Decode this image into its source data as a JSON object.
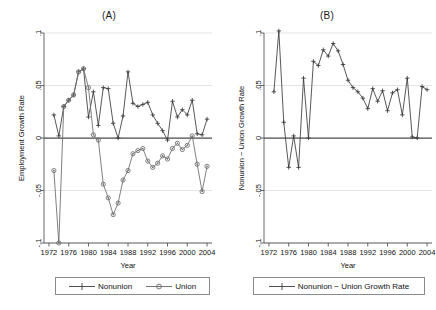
{
  "figure": {
    "background": "#ffffff",
    "axis_color": "#555555",
    "grid_color": "#d8d8d8",
    "series_color": "#3a3a3a",
    "union_color": "#6a6a6a"
  },
  "panels": [
    {
      "id": "panel-a",
      "title": "(A)",
      "ylabel": "Employment Growth Rate",
      "xlabel": "Year",
      "legend": [
        {
          "label": "Nonunion",
          "marker": "plus"
        },
        {
          "label": "Union",
          "marker": "circle-dot"
        }
      ]
    },
    {
      "id": "panel-b",
      "title": "(B)",
      "ylabel": "Nonunion − Union Growth Rate",
      "xlabel": "Year",
      "legend": [
        {
          "label": "Nonunion − Union Growth Rate",
          "marker": "plus"
        }
      ]
    }
  ],
  "chart_data": [
    {
      "type": "line",
      "panel": "(A)",
      "title": "(A)",
      "xlabel": "Year",
      "ylabel": "Employment Growth Rate",
      "xlim": [
        1971,
        2005
      ],
      "ylim": [
        -0.1,
        0.1
      ],
      "xticks": [
        1972,
        1976,
        1980,
        1984,
        1988,
        1992,
        1996,
        2000,
        2004
      ],
      "yticks": [
        -0.1,
        -0.05,
        0,
        0.05,
        0.1
      ],
      "ytick_labels": [
        "-.1",
        "-.05",
        "0",
        ".05",
        ".1"
      ],
      "grid": true,
      "legend_position": "below",
      "x": [
        1973,
        1974,
        1975,
        1976,
        1977,
        1978,
        1979,
        1980,
        1981,
        1982,
        1983,
        1984,
        1985,
        1986,
        1987,
        1988,
        1989,
        1990,
        1991,
        1992,
        1993,
        1994,
        1995,
        1996,
        1997,
        1998,
        1999,
        2000,
        2001,
        2002,
        2003,
        2004
      ],
      "series": [
        {
          "name": "Nonunion",
          "marker": "plus",
          "color": "#3a3a3a",
          "values": [
            0.022,
            0.002,
            0.03,
            0.036,
            0.041,
            0.063,
            0.066,
            0.02,
            0.044,
            0.012,
            0.048,
            0.047,
            0.014,
            0.0,
            0.021,
            0.063,
            0.033,
            0.03,
            0.032,
            0.034,
            0.022,
            0.014,
            0.007,
            -0.002,
            0.035,
            0.02,
            0.027,
            0.022,
            0.036,
            0.004,
            0.003,
            0.018
          ]
        },
        {
          "name": "Union",
          "marker": "circle-dot",
          "color": "#6a6a6a",
          "values": [
            -0.031,
            -0.1,
            0.03,
            0.036,
            0.041,
            0.063,
            0.066,
            0.048,
            0.003,
            -0.002,
            -0.044,
            -0.057,
            -0.073,
            -0.062,
            -0.04,
            -0.031,
            -0.015,
            -0.012,
            -0.01,
            -0.022,
            -0.028,
            -0.024,
            -0.017,
            -0.02,
            -0.01,
            -0.005,
            -0.011,
            -0.007,
            0.002,
            -0.025,
            -0.051,
            -0.027
          ]
        }
      ]
    },
    {
      "type": "line",
      "panel": "(B)",
      "title": "(B)",
      "xlabel": "Year",
      "ylabel": "Nonunion − Union Growth Rate",
      "xlim": [
        1971,
        2005
      ],
      "ylim": [
        -0.1,
        0.1
      ],
      "xticks": [
        1972,
        1976,
        1980,
        1984,
        1988,
        1992,
        1996,
        2000,
        2004
      ],
      "yticks": [
        -0.1,
        -0.05,
        0,
        0.05,
        0.1
      ],
      "ytick_labels": [
        "-.1",
        "-.05",
        "0",
        ".05",
        ".1"
      ],
      "grid": true,
      "legend_position": "below",
      "x": [
        1973,
        1974,
        1975,
        1976,
        1977,
        1978,
        1979,
        1980,
        1981,
        1982,
        1983,
        1984,
        1985,
        1986,
        1987,
        1988,
        1989,
        1990,
        1991,
        1992,
        1993,
        1994,
        1995,
        1996,
        1997,
        1998,
        1999,
        2000,
        2001,
        2002,
        2003,
        2004
      ],
      "series": [
        {
          "name": "Nonunion − Union Growth Rate",
          "marker": "plus",
          "color": "#3a3a3a",
          "values": [
            0.044,
            0.102,
            0.015,
            -0.028,
            0.002,
            -0.028,
            0.057,
            0.0,
            0.073,
            0.069,
            0.084,
            0.078,
            0.09,
            0.083,
            0.07,
            0.055,
            0.048,
            0.044,
            0.038,
            0.028,
            0.047,
            0.035,
            0.045,
            0.026,
            0.043,
            0.046,
            0.022,
            0.057,
            0.001,
            0.0,
            0.049,
            0.046
          ]
        }
      ]
    }
  ]
}
